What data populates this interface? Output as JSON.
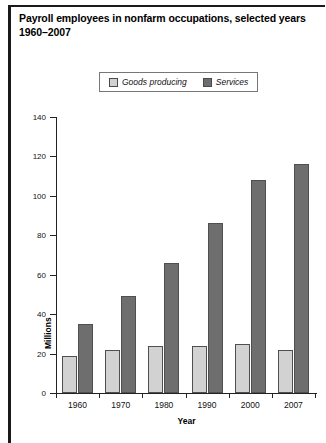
{
  "title": "Payroll employees in nonfarm occupations, selected years 1960–2007",
  "legend": {
    "entries": [
      {
        "label": "Goods producing",
        "color": "#d2d2d2"
      },
      {
        "label": "Services",
        "color": "#6e6e6e"
      }
    ]
  },
  "chart_data": {
    "type": "bar",
    "title": "Payroll employees in nonfarm occupations, selected years 1960–2007",
    "xlabel": "Year",
    "ylabel": "Millions",
    "categories": [
      "1960",
      "1970",
      "1980",
      "1990",
      "2000",
      "2007"
    ],
    "series": [
      {
        "name": "Goods producing",
        "color": "#d2d2d2",
        "values": [
          19,
          22,
          24,
          24,
          25,
          22
        ]
      },
      {
        "name": "Services",
        "color": "#6e6e6e",
        "values": [
          35,
          49,
          66,
          86,
          108,
          116
        ]
      }
    ],
    "ylim": [
      0,
      140
    ],
    "yticks": [
      0,
      20,
      40,
      60,
      80,
      100,
      120,
      140
    ],
    "ytick_labels": [
      "0",
      "20",
      "40",
      "60",
      "80",
      "100",
      "120",
      "140"
    ],
    "grid": false,
    "legend_position": "top-center"
  },
  "axes": {
    "x_title": "Year",
    "y_title": "Millions"
  }
}
